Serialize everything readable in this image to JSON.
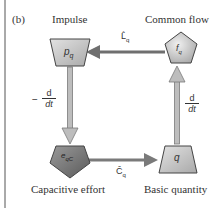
{
  "figure": {
    "panel_label": "(b)",
    "colors": {
      "border": "#555555",
      "arrow": "#8a8a8a",
      "arrow_dark": "#6f6f6f",
      "shape_light": "#c8c8c8",
      "shape_dark": "#7a7a7a",
      "shape_stroke": "#444444"
    }
  },
  "nodes": [
    {
      "id": "impulse",
      "title": "Impulse",
      "symbol": "p",
      "subscript": "q",
      "shape": "trapezoid-inverted"
    },
    {
      "id": "common-flow",
      "title": "Common flow",
      "symbol": "f",
      "subscript": "q",
      "shape": "pentagon"
    },
    {
      "id": "capacitive-effort",
      "title": "Capacitive effort",
      "symbol": "e",
      "subscript": "qC",
      "shape": "pentagon-inverted"
    },
    {
      "id": "basic-quantity",
      "title": "Basic quantity",
      "symbol": "q",
      "subscript": "",
      "shape": "trapezoid"
    }
  ],
  "edges": [
    {
      "from": "common-flow",
      "to": "impulse",
      "label": "L̂",
      "label_sub": "q"
    },
    {
      "from": "impulse",
      "to": "capacitive-effort",
      "label_prefix": "−",
      "label_num": "d",
      "label_den": "dt"
    },
    {
      "from": "capacitive-effort",
      "to": "basic-quantity",
      "label": "Ĉ",
      "label_sub": "q"
    },
    {
      "from": "basic-quantity",
      "to": "common-flow",
      "label_num": "d",
      "label_den": "dt"
    }
  ]
}
